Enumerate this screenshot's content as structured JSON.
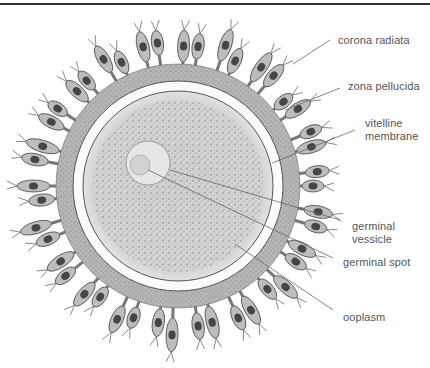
{
  "figure": {
    "colors": {
      "background": "#ffffff",
      "label_text": "#555555",
      "leader_line": "#666666",
      "cell_stroke": "#4a4a4a",
      "cell_fill": "#b8b8b8",
      "nucleus_fill": "#3c3c3c",
      "zona": "#fafafa",
      "ooplasm": "#c9c9c9",
      "vesicle": "#e4e4e4"
    }
  },
  "labels": [
    {
      "id": "corona-radiata",
      "lines": [
        "corona radiata"
      ]
    },
    {
      "id": "zona-pellucida",
      "lines": [
        "zona pellucida"
      ]
    },
    {
      "id": "vitelline-membrane",
      "lines": [
        "vitelline",
        "membrane"
      ]
    },
    {
      "id": "germinal-vessicle",
      "lines": [
        "germinal",
        "vessicle"
      ]
    },
    {
      "id": "germinal-spot",
      "lines": [
        "germinal spot"
      ]
    },
    {
      "id": "ooplasm",
      "lines": [
        "ooplasm"
      ]
    }
  ]
}
